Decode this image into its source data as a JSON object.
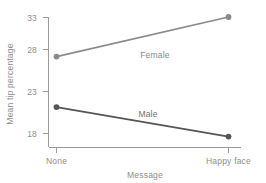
{
  "chart_data": {
    "type": "line",
    "title": "",
    "xlabel": "Message",
    "ylabel": "Mean tip percentage",
    "categories": [
      "None",
      "Happy face"
    ],
    "series": [
      {
        "name": "Female",
        "values": [
          27.9,
          33.0
        ],
        "color": "#8a8a8a"
      },
      {
        "name": "Male",
        "values": [
          21.4,
          17.6
        ],
        "color": "#555555"
      }
    ],
    "yticks": [
      18,
      23,
      28,
      33
    ],
    "ylim": [
      16.5,
      34.0
    ],
    "xlim": [
      0,
      1
    ],
    "grid": false,
    "legend": "inline-series-labels",
    "annotations": [
      {
        "text": "Female",
        "series": "Female"
      },
      {
        "text": "Male",
        "series": "Male"
      }
    ]
  },
  "axis": {
    "y_title": "Mean tip percentage",
    "x_title": "Message",
    "y_tick_labels": [
      "33",
      "28",
      "23",
      "18"
    ],
    "x_tick_labels": [
      "None",
      "Happy face"
    ]
  },
  "series_labels": {
    "female": "Female",
    "male": "Male"
  },
  "colors": {
    "female": "#8a8a8a",
    "male": "#555555",
    "axis": "#9b9b9b",
    "text": "#8e8e8e",
    "background": "#ffffff"
  }
}
